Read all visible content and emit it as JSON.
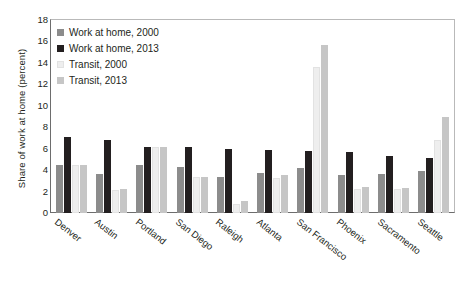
{
  "chart_data": {
    "type": "bar",
    "title": "",
    "xlabel": "",
    "ylabel": "Share of work at home (percent)",
    "ylim": [
      0,
      18
    ],
    "yticks": [
      0,
      2,
      4,
      6,
      8,
      10,
      12,
      14,
      16,
      18
    ],
    "grid": false,
    "legend_position": "top-left inside plot",
    "categories": [
      "Denver",
      "Austin",
      "Portland",
      "San Diego",
      "Raleigh",
      "Atlanta",
      "San Francisco",
      "Phoenix",
      "Sacramento",
      "Seattle"
    ],
    "series": [
      {
        "name": "Work at home, 2000",
        "color": "#8c8c8c",
        "values": [
          4.5,
          3.6,
          4.5,
          4.3,
          3.4,
          3.7,
          4.2,
          3.5,
          3.6,
          3.9
        ]
      },
      {
        "name": "Work at home, 2013",
        "color": "#231f20",
        "values": [
          7.1,
          6.8,
          6.2,
          6.2,
          6.0,
          5.9,
          5.8,
          5.7,
          5.3,
          5.1
        ]
      },
      {
        "name": "Transit, 2000",
        "color": "#eeeeee",
        "values": [
          4.5,
          2.1,
          6.2,
          3.4,
          0.8,
          3.3,
          13.6,
          2.2,
          2.2,
          6.8
        ]
      },
      {
        "name": "Transit, 2013",
        "color": "#c6c6c6",
        "values": [
          4.5,
          2.2,
          6.2,
          3.4,
          1.1,
          3.5,
          15.7,
          2.4,
          2.3,
          9.0
        ]
      }
    ]
  },
  "axis": {
    "y_title": "Share of work at home (percent)"
  },
  "legend": {
    "items": [
      {
        "label": "Work at home, 2000",
        "color": "#8c8c8c"
      },
      {
        "label": "Work at home, 2013",
        "color": "#231f20"
      },
      {
        "label": "Transit, 2000",
        "color": "#eeeeee"
      },
      {
        "label": "Transit, 2013",
        "color": "#c6c6c6"
      }
    ]
  }
}
